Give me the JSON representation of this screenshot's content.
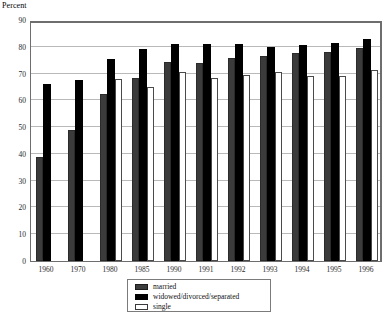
{
  "axis_title": "Percent",
  "legend": {
    "entries": [
      {
        "key": "married",
        "label": "married",
        "color": "#3b3b3b"
      },
      {
        "key": "wds",
        "label": "widowed/divorced/separated",
        "color": "#000000"
      },
      {
        "key": "single",
        "label": "single",
        "color": "#ffffff"
      }
    ]
  },
  "chart_data": {
    "type": "bar",
    "title": "",
    "subtitle": "",
    "xlabel": "",
    "ylabel": "Percent",
    "ylim": [
      0,
      90
    ],
    "yticks": [
      0,
      10,
      20,
      30,
      40,
      50,
      60,
      70,
      80,
      90
    ],
    "ytick_labels": [
      "0",
      "10",
      "20",
      "30",
      "40",
      "50",
      "60",
      "70",
      "80",
      "90"
    ],
    "grid": true,
    "legend_position": "bottom-center",
    "categories": [
      "1960",
      "1970",
      "1980",
      "1985",
      "1990",
      "1991",
      "1992",
      "1993",
      "1994",
      "1995",
      "1996"
    ],
    "series": [
      {
        "name": "married",
        "color": "#3b3b3b",
        "values": [
          39,
          49,
          62.5,
          68.5,
          74.5,
          74,
          76,
          76.5,
          77.5,
          78,
          79.5
        ]
      },
      {
        "name": "widowed/divorced/separated",
        "color": "#000000",
        "values": [
          66,
          67.5,
          75.5,
          79,
          81,
          81,
          81,
          80,
          80.5,
          81.5,
          83
        ]
      },
      {
        "name": "single",
        "color": "#ffffff",
        "values": [
          null,
          null,
          68,
          65,
          70.5,
          68.5,
          69.5,
          70.5,
          69,
          69,
          71.5
        ]
      }
    ]
  }
}
